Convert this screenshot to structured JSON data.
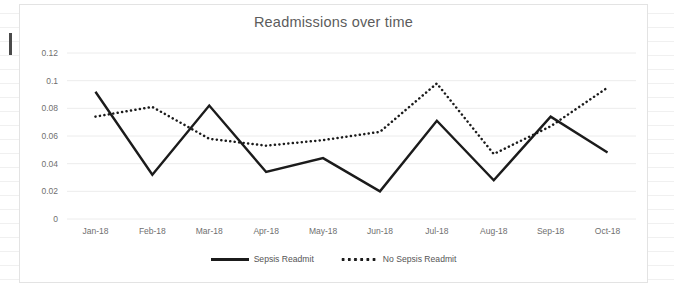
{
  "chart_data": {
    "type": "line",
    "title": "Readmissions over time",
    "xlabel": "",
    "ylabel": "",
    "categories": [
      "Jan-18",
      "Feb-18",
      "Mar-18",
      "Apr-18",
      "May-18",
      "Jun-18",
      "Jul-18",
      "Aug-18",
      "Sep-18",
      "Oct-18"
    ],
    "series": [
      {
        "name": "Sepsis Readmit",
        "style": "solid",
        "color": "#1b1b1b",
        "values": [
          0.092,
          0.032,
          0.082,
          0.034,
          0.044,
          0.02,
          0.071,
          0.028,
          0.074,
          0.048
        ]
      },
      {
        "name": "No Sepsis Readmit",
        "style": "dotted",
        "color": "#1b1b1b",
        "values": [
          0.074,
          0.081,
          0.058,
          0.053,
          0.057,
          0.063,
          0.098,
          0.047,
          0.067,
          0.095
        ]
      }
    ],
    "ylim": [
      0,
      0.12
    ],
    "yticks": [
      0,
      0.02,
      0.04,
      0.06,
      0.08,
      0.1,
      0.12
    ],
    "ytick_labels": [
      "0",
      "0.02",
      "0.04",
      "0.06",
      "0.08",
      "0.1",
      "0.12"
    ],
    "grid": true,
    "legend_position": "bottom"
  },
  "legend": {
    "entries": [
      {
        "label": "Sepsis Readmit"
      },
      {
        "label": "No Sepsis Readmit"
      }
    ]
  }
}
